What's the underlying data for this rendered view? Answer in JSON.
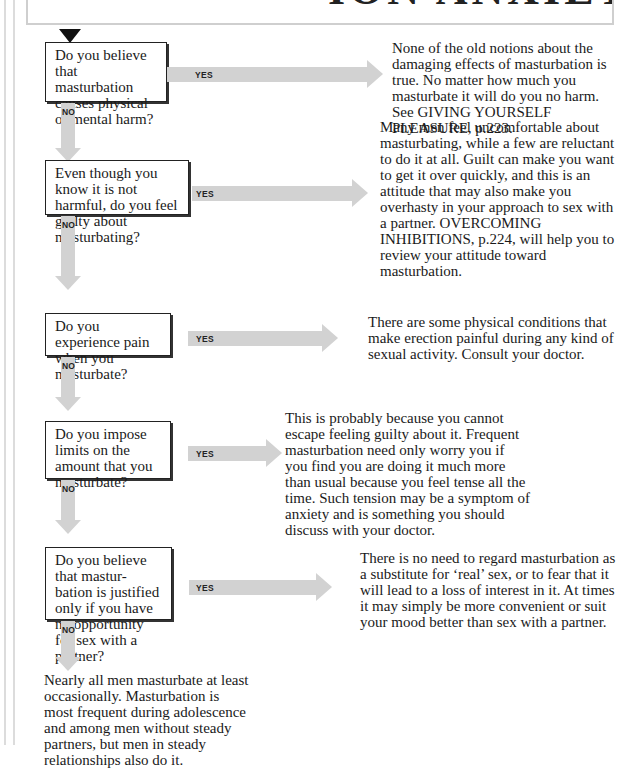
{
  "page": {
    "title_fragment": "ION ANXIETY"
  },
  "flowchart": {
    "yes_label": "YES",
    "no_label": "NO",
    "questions": [
      {
        "text": "Do you believe that masturbation causes physical or mental harm?",
        "answer": "None of the old notions about the damaging effects of masturbation is true. No matter how much you masturbate it will do you no harm. See GIVING YOURSELF PLEASURE, p.223."
      },
      {
        "text": "Even though you know it is not harmful, do you feel guilty about masturbating?",
        "answer": "Many men feel uncomfortable about masturbating, while a few are reluctant to do it at all. Guilt can make you want to get it over quickly, and this is an attitude that may also make you overhasty in your approach to sex with a partner. OVERCOMING INHIBITIONS, p.224, will help you to review your attitude toward masturbation."
      },
      {
        "text": "Do you experience pain when you masturbate?",
        "answer": "There are some physical conditions that make erection painful during any kind of sexual activity. Consult your doctor."
      },
      {
        "text": "Do you impose limits on the amount that you masturbate?",
        "answer": "This is probably because you cannot escape feeling guilty about it. Frequent masturbation need only worry you if you find you are doing it much more than usual because you feel tense all the time. Such tension may be a symptom of anxiety and is something you should discuss with your doctor."
      },
      {
        "text": "Do you believe that mastur-bation is justified only if you have no opportunity for sex with a partner?",
        "answer": "There is no need to regard masturbation as a substitute for ‘real’ sex, or to fear that it will lead to a loss of interest in it. At times it may simply be more convenient or suit your mood better than sex with a partner."
      }
    ],
    "conclusion": "Nearly all men masturbate at least occasionally. Masturbation is most frequent during adolescence and among men without steady partners, but men in steady relationships also do it."
  },
  "colors": {
    "arrow_fill": "#d2d2d2",
    "box_border": "#222222",
    "text": "#1a1a1a"
  }
}
